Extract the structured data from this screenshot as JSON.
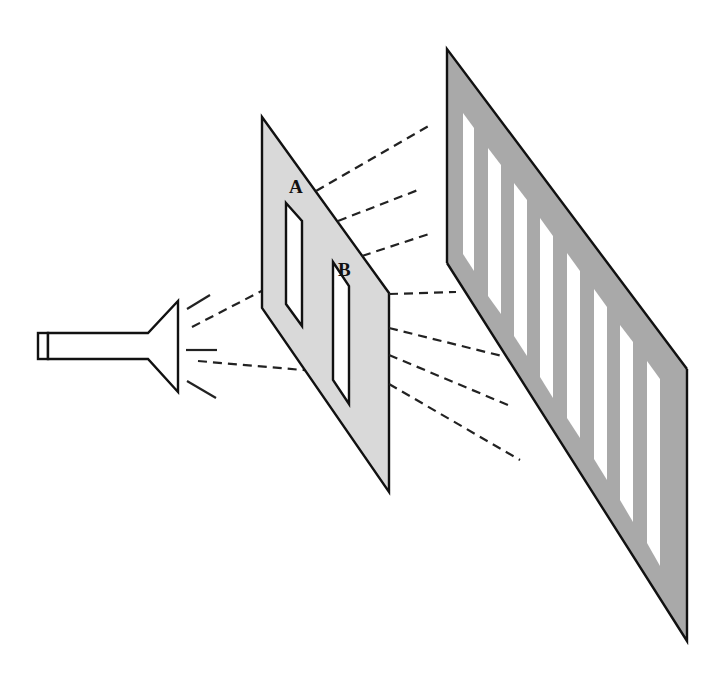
{
  "figure": {
    "labels": {
      "slit_a": "A",
      "slit_b": "B"
    },
    "colors": {
      "background": "#ffffff",
      "barrier_fill": "#d9d9d9",
      "screen_fill": "#a9a9a9",
      "outline": "#111111",
      "slit_fill": "#ffffff",
      "fringe_fill": "#ffffff"
    },
    "components": [
      {
        "name": "light-source",
        "description": "flashlight emitting rays"
      },
      {
        "name": "barrier",
        "description": "light gray panel with two slits A and B"
      },
      {
        "name": "screen",
        "description": "dark gray panel showing 7 bright interference fringes"
      }
    ],
    "fringe_count": 7
  }
}
